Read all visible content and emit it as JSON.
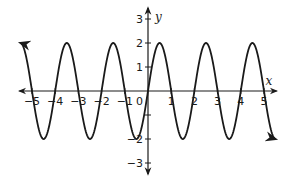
{
  "chart_data": {
    "type": "line",
    "title": "",
    "function": "y = 2 sin(pi x)",
    "xlabel": "x",
    "ylabel": "y",
    "xlim": [
      -5.5,
      5.5
    ],
    "ylim": [
      -3.5,
      3.5
    ],
    "x_ticks": [
      -5,
      -4,
      -3,
      -2,
      -1,
      0,
      1,
      2,
      3,
      4,
      5
    ],
    "x_tick_labels": [
      "−5",
      "−4",
      "−3",
      "−2",
      "−1",
      "0",
      "1",
      "2",
      "3",
      "4",
      "5"
    ],
    "y_ticks": [
      -3,
      -2,
      -1,
      1,
      2,
      3
    ],
    "y_tick_labels": [
      "−3",
      "−2",
      "",
      "1",
      "2",
      "3"
    ],
    "amplitude": 2,
    "period": 2,
    "grid": false,
    "legend": null,
    "series": [
      {
        "name": "curve",
        "color": "#1a1a1a",
        "x": [
          -5.5,
          -5,
          -4.5,
          -4,
          -3.5,
          -3,
          -2.5,
          -2,
          -1.5,
          -1,
          -0.5,
          0,
          0.5,
          1,
          1.5,
          2,
          2.5,
          3,
          3.5,
          4,
          4.5,
          5,
          5.5
        ],
        "y": [
          2,
          0,
          -2,
          0,
          2,
          0,
          -2,
          0,
          2,
          0,
          -2,
          0,
          2,
          0,
          -2,
          0,
          2,
          0,
          -2,
          0,
          2,
          0,
          -2
        ]
      }
    ],
    "end_arrows": true
  },
  "layout": {
    "origin_px": [
      148,
      91
    ],
    "unit_x_px": 23.2,
    "unit_y_px": 24,
    "axis_color": "#1a1a1a"
  }
}
